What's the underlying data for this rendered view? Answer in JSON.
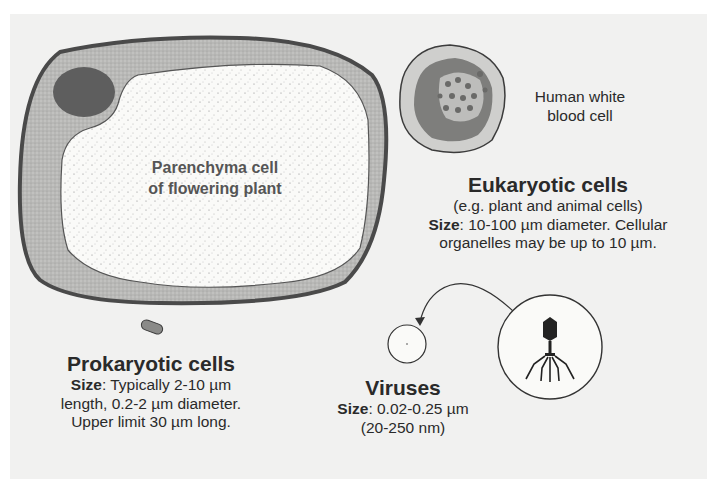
{
  "diagram": {
    "type": "cell size comparison",
    "colors": {
      "background": "#f1f1f0",
      "cell_wall": "#4a4a4a",
      "cytoplasm": "#b9b9b9",
      "vacuole": "#fafaf8",
      "nucleus": "#5e5e5e",
      "text": "#2a2a2a"
    },
    "plant_cell": {
      "label_line1": "Parenchyma cell",
      "label_line2": "of flowering plant"
    },
    "white_blood_cell": {
      "label_line1": "Human white",
      "label_line2": "blood cell"
    },
    "eukaryotic": {
      "title": "Eukaryotic cells",
      "subtitle": "(e.g. plant and animal cells)",
      "size_label": "Size",
      "size_text": ": 10-100 µm diameter. Cellular",
      "size_text2": "organelles may be up to 10 µm."
    },
    "prokaryotic": {
      "title": "Prokaryotic cells",
      "size_label": "Size",
      "size_text": ": Typically 2-10 µm",
      "size_text2": "length, 0.2-2 µm diameter.",
      "size_text3": "Upper limit 30 µm long."
    },
    "viruses": {
      "title": "Viruses",
      "size_label": "Size",
      "size_text": ": 0.02-0.25 µm",
      "size_text2": "(20-250 nm)"
    },
    "icons": [
      "bacteriophage-icon",
      "arrow-icon",
      "bacterium-icon"
    ]
  }
}
